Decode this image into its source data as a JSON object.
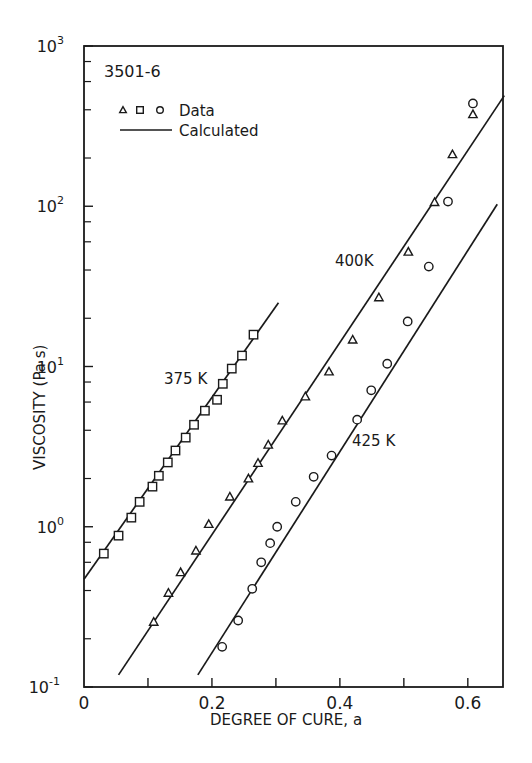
{
  "chart_data": {
    "type": "scatter",
    "title": "",
    "material_label": "3501-6",
    "xlabel": "DEGREE OF CURE, a",
    "ylabel": "VISCOSITY (Pa s)",
    "xlim": [
      0,
      0.655
    ],
    "ylim": [
      0.1,
      1000
    ],
    "yscale": "log",
    "grid": false,
    "x_ticks": [
      0,
      0.1,
      0.2,
      0.3,
      0.4,
      0.5,
      0.6
    ],
    "x_tick_labels": [
      "0",
      "",
      "0.2",
      "",
      "0.4",
      "",
      "0.6"
    ],
    "y_ticks": [
      0.1,
      1,
      10,
      100,
      1000
    ],
    "y_tick_labels": [
      {
        "base": "10",
        "exp": "-1"
      },
      {
        "base": "10",
        "exp": "0"
      },
      {
        "base": "10",
        "exp": "1"
      },
      {
        "base": "10",
        "exp": "2"
      },
      {
        "base": "10",
        "exp": "3"
      }
    ],
    "legend": {
      "position": "upper-left",
      "entries": [
        {
          "label": "Data",
          "markers": [
            "triangle",
            "square",
            "circle"
          ]
        },
        {
          "label": "Calculated",
          "style": "line"
        }
      ]
    },
    "series": [
      {
        "name": "375K",
        "marker": "square",
        "annotation": {
          "text": "375 K",
          "x": 0.165,
          "y": 8.5
        },
        "calculated_line": {
          "x": [
            0.0,
            0.304
          ],
          "y": [
            0.47,
            25
          ]
        },
        "x": [
          0.031,
          0.054,
          0.074,
          0.087,
          0.107,
          0.117,
          0.131,
          0.143,
          0.159,
          0.172,
          0.189,
          0.208,
          0.217,
          0.231,
          0.247,
          0.265
        ],
        "y": [
          0.68,
          0.88,
          1.14,
          1.43,
          1.78,
          2.08,
          2.52,
          2.99,
          3.6,
          4.33,
          5.3,
          6.2,
          7.8,
          9.7,
          11.7,
          15.8
        ]
      },
      {
        "name": "400K",
        "marker": "triangle",
        "annotation": {
          "text": "400K",
          "x": 0.395,
          "y": 42
        },
        "calculated_line": {
          "x": [
            0.054,
            0.657
          ],
          "y": [
            0.119,
            490
          ]
        },
        "x": [
          0.109,
          0.132,
          0.151,
          0.175,
          0.195,
          0.228,
          0.257,
          0.272,
          0.288,
          0.31,
          0.346,
          0.383,
          0.42,
          0.461,
          0.507,
          0.548,
          0.576,
          0.608
        ],
        "y": [
          0.255,
          0.387,
          0.52,
          0.71,
          1.04,
          1.54,
          2.0,
          2.5,
          3.25,
          4.6,
          6.5,
          9.3,
          14.7,
          27,
          52,
          106,
          211,
          375
        ]
      },
      {
        "name": "425K",
        "marker": "circle",
        "annotation": {
          "text": "425 K",
          "x": 0.425,
          "y": 2.0
        },
        "calculated_line": {
          "x": [
            0.178,
            0.646
          ],
          "y": [
            0.119,
            103
          ]
        },
        "x": [
          0.216,
          0.241,
          0.263,
          0.277,
          0.291,
          0.302,
          0.331,
          0.359,
          0.387,
          0.427,
          0.449,
          0.474,
          0.506,
          0.539,
          0.569,
          0.608
        ],
        "y": [
          0.178,
          0.26,
          0.41,
          0.6,
          0.79,
          1.0,
          1.43,
          2.05,
          2.78,
          4.66,
          7.1,
          10.4,
          19.1,
          42,
          107,
          438
        ]
      }
    ]
  },
  "colors": {
    "ink": "#1a1a1a",
    "background": "#ffffff"
  }
}
